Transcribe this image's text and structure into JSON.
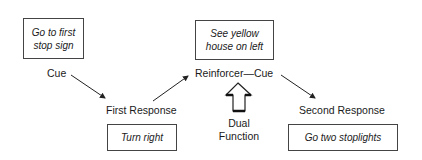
{
  "diagram": {
    "boxes": [
      {
        "id": "box-cue",
        "text_line1": "Go to first",
        "text_line2": "stop sign"
      },
      {
        "id": "box-reinforcer-cue",
        "text_line1": "See yellow",
        "text_line2": "house on left"
      },
      {
        "id": "box-first-response",
        "text": "Turn right"
      },
      {
        "id": "box-second-response",
        "text": "Go two stoplights"
      }
    ],
    "labels": {
      "cue": "Cue",
      "first_response": "First Response",
      "reinforcer_cue": "Reinforcer—Cue",
      "second_response": "Second Response",
      "dual_line1": "Dual",
      "dual_line2": "Function"
    },
    "arrows": [
      {
        "from": "Cue",
        "to": "First Response"
      },
      {
        "from": "First Response",
        "to": "Reinforcer—Cue"
      },
      {
        "from": "Reinforcer—Cue",
        "to": "Second Response"
      },
      {
        "from": "Dual Function",
        "to": "Reinforcer—Cue",
        "style": "block-up-arrow"
      }
    ]
  }
}
